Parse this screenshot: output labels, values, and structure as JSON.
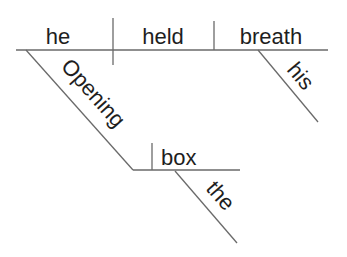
{
  "diagram": {
    "type": "sentence-diagram",
    "style": "Reed-Kellogg",
    "words": {
      "subject": "he",
      "verb": "held",
      "direct_object": "breath",
      "object_modifier": "his",
      "participle": "Opening",
      "participle_object": "box",
      "participle_object_modifier": "the"
    },
    "colors": {
      "text": "#1e1e1e",
      "lines": "#6a6a6a",
      "background": "#ffffff"
    }
  }
}
